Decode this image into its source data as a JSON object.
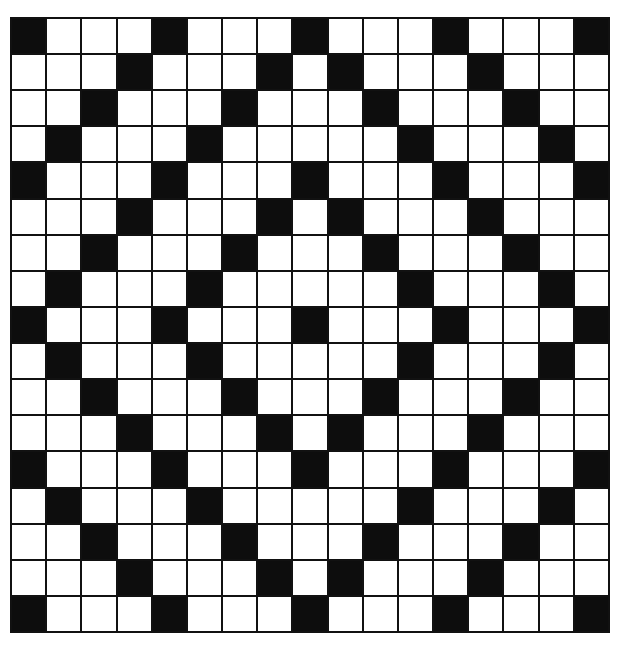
{
  "puzzle": {
    "type": "crossword-grid",
    "rows": 17,
    "cols": 17,
    "colors": {
      "black": "#0d0d0d",
      "white": "#ffffff",
      "line": "#111111"
    },
    "black_cells_by_row": [
      [
        0,
        4,
        8,
        12,
        16
      ],
      [
        3,
        7,
        9,
        13
      ],
      [
        2,
        6,
        10,
        14
      ],
      [
        1,
        5,
        11,
        15
      ],
      [
        0,
        4,
        8,
        12,
        16
      ],
      [
        3,
        7,
        9,
        13
      ],
      [
        2,
        6,
        10,
        14
      ],
      [
        1,
        5,
        11,
        15
      ],
      [
        0,
        4,
        8,
        12,
        16
      ],
      [
        1,
        5,
        11,
        15
      ],
      [
        2,
        6,
        10,
        14
      ],
      [
        3,
        7,
        9,
        13
      ],
      [
        0,
        4,
        8,
        12,
        16
      ],
      [
        1,
        5,
        11,
        15
      ],
      [
        2,
        6,
        10,
        14
      ],
      [
        3,
        7,
        9,
        13
      ],
      [
        0,
        4,
        8,
        12,
        16
      ]
    ]
  }
}
